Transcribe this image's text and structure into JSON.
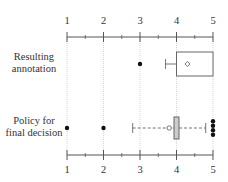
{
  "chart_data": {
    "type": "boxplot",
    "title": "",
    "xlabel": "",
    "ylabel": "",
    "xlim": [
      1,
      5
    ],
    "x_ticks": [
      1,
      2,
      3,
      4,
      5
    ],
    "x_minor_ticks": [
      1.5,
      2.5,
      3.5,
      4.5
    ],
    "grid": "vertical dotted at major ticks",
    "axes": [
      "top",
      "bottom"
    ],
    "series": [
      {
        "name": "Resulting annotation",
        "label_lines": [
          "Resulting",
          "annotation"
        ],
        "q1": 4,
        "median": 4,
        "q3": 5,
        "whisker_low": 3.7,
        "whisker_high": 5,
        "mean": 4.3,
        "outliers": [
          3
        ]
      },
      {
        "name": "Policy for final decision",
        "label_lines": [
          "Policy for",
          "final decision"
        ],
        "q1": 3.95,
        "median": 4,
        "q3": 4.05,
        "whisker_low": 2.8,
        "whisker_high": 4.8,
        "mean": 3.8,
        "outliers": [
          1,
          2,
          5,
          5,
          5,
          5
        ]
      }
    ]
  },
  "colors": {
    "axis": "#555555",
    "grid": "#bbbbbb",
    "box_edge": "#666666",
    "box_fill_narrow": "#cccccc",
    "point": "#111111"
  }
}
